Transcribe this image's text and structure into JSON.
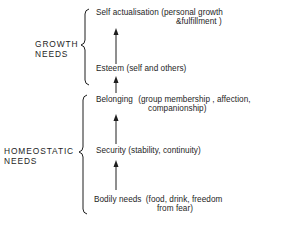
{
  "diagram": {
    "type": "needs-hierarchy",
    "groups": [
      {
        "id": "growth",
        "label_line1": "GROWTH",
        "label_line2": "NEEDS"
      },
      {
        "id": "homeostatic",
        "label_line1": "HOMEOSTATIC",
        "label_line2": "NEEDS"
      }
    ],
    "levels": [
      {
        "name": "Self actualisation",
        "detail_line1": "(personal growth",
        "detail_line2": "&fulfillment )",
        "group": "growth"
      },
      {
        "name": "Esteem",
        "detail_line1": "(self and others)",
        "group": "growth"
      },
      {
        "name": "Belonging",
        "detail_line1": "(group membership , affection,",
        "detail_line2": "companionship)",
        "group": "homeostatic"
      },
      {
        "name": "Security",
        "detail_line1": "(stability, continuity)",
        "group": "homeostatic"
      },
      {
        "name": "Bodily needs",
        "detail_line1": "(food, drink, freedom",
        "detail_line2": "from fear)",
        "group": "homeostatic"
      }
    ],
    "arrows": [
      {
        "from": "Esteem",
        "to": "Self actualisation"
      },
      {
        "from": "Belonging",
        "to": "Esteem"
      },
      {
        "from": "Security",
        "to": "Belonging"
      },
      {
        "from": "Bodily needs",
        "to": "Security"
      }
    ],
    "colors": {
      "ink": "#1e1e1e",
      "background": "#ffffff"
    }
  }
}
